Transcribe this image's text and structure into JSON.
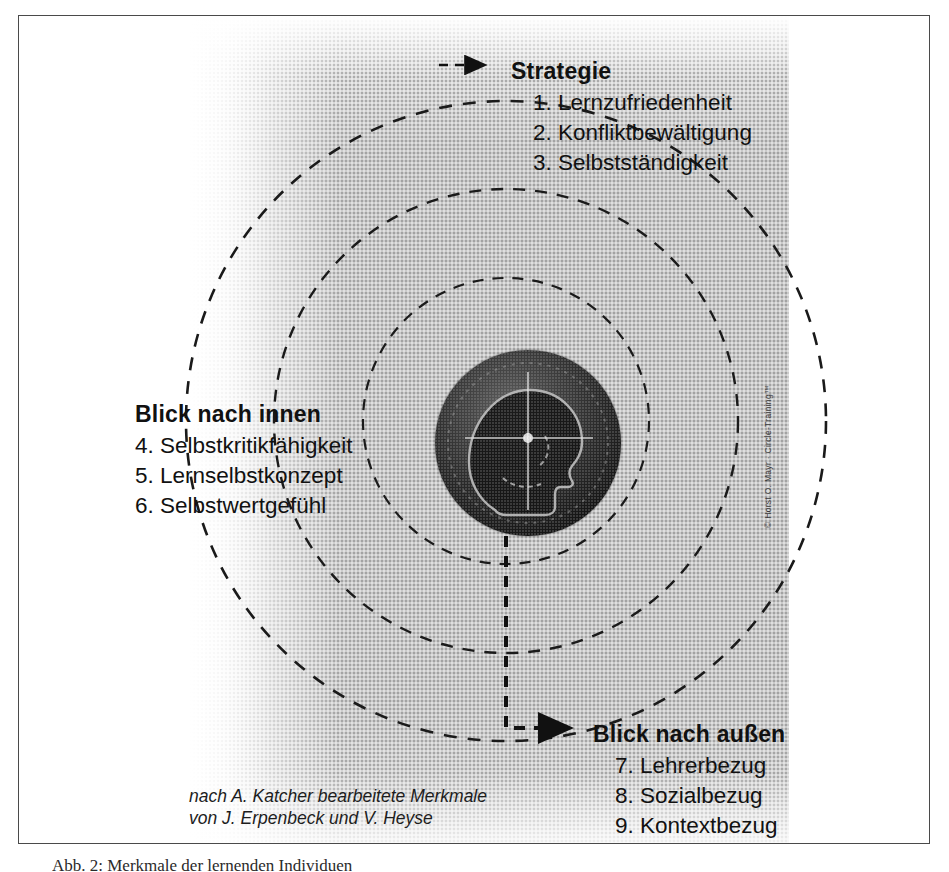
{
  "figure": {
    "caption_below": "Abb. 2: Merkmale der lernenden Individuen",
    "attribution_line1": "nach A. Katcher bearbeitete Merkmale",
    "attribution_line2": "von J. Erpenbeck und V. Heyse",
    "copyright": "© Horst O. Mayr · Circle-Training™"
  },
  "blocks": {
    "strategie": {
      "title": "Strategie",
      "items": [
        "1. Lernzufriedenheit",
        "2. Konfliktbewältigung",
        "3. Selbstständigkeit"
      ]
    },
    "innen": {
      "title": "Blick nach innen",
      "items": [
        "4. Selbstkritikfähigkeit",
        "5. Lernselbstkonzept",
        "6. Selbstwertgefühl"
      ]
    },
    "aussen": {
      "title": "Blick nach außen",
      "items": [
        "7. Lehrerbezug",
        "8. Sozialbezug",
        "9. Kontextbezug"
      ]
    }
  },
  "center": {
    "image_name": "head-profile-with-crosshair"
  },
  "colors": {
    "frame": "#4a4a4a",
    "panel": "#c9c9c9",
    "dashed_line": "#1a1a1a",
    "text": "#111111"
  }
}
